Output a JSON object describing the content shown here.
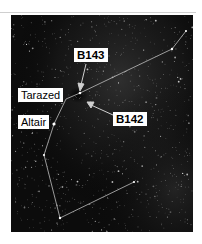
{
  "figure": {
    "labels": [
      {
        "id": "b143",
        "text": "B143",
        "bold": true
      },
      {
        "id": "tarazed",
        "text": "Tarazed",
        "bold": false
      },
      {
        "id": "b142",
        "text": "B142",
        "bold": true
      },
      {
        "id": "altair",
        "text": "Altair",
        "bold": false
      }
    ],
    "colors": {
      "sky": "#0c0c0c",
      "constellation_line": "#bdbdbd",
      "label_bg": "#ffffff",
      "label_text": "#000000",
      "top_rule": "#cfcfcf"
    }
  }
}
